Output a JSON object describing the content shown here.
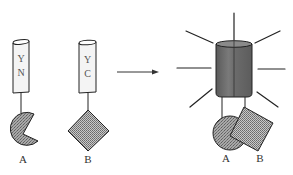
{
  "diagram": {
    "type": "protein-complementation-schematic",
    "colors": {
      "stroke": "#222222",
      "fragment_fill": "#f4f4f4",
      "reconstituted_fill": "#6e6e6e",
      "domain_fill": "#9a9a9a",
      "ray": "#222222"
    },
    "before": {
      "left_construct": {
        "fragment_label_top": "Y",
        "fragment_label_bottom": "N",
        "domain_shape": "pacman-circle",
        "domain_label": "A"
      },
      "right_construct": {
        "fragment_label_top": "Y",
        "fragment_label_bottom": "C",
        "domain_shape": "diamond",
        "domain_label": "B"
      }
    },
    "arrow": {
      "direction": "right"
    },
    "after": {
      "state": "reconstituted-fluorescent",
      "glow_rays": 7,
      "domain_labels": [
        "A",
        "B"
      ]
    }
  }
}
